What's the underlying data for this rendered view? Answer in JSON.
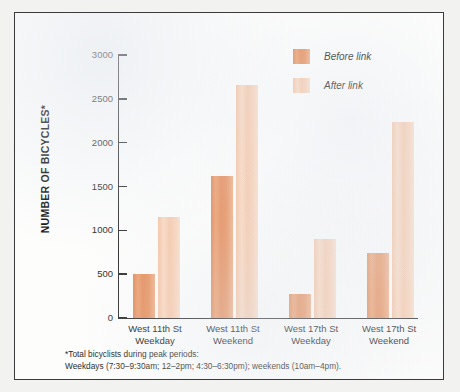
{
  "chart_data": {
    "type": "bar",
    "title": "",
    "xlabel": "",
    "ylabel": "NUMBER OF BICYCLES*",
    "ylim": [
      0,
      3000
    ],
    "ytick_values": [
      3000,
      2500,
      2000,
      1500,
      1000,
      500,
      0
    ],
    "ytick_labels": [
      "3000",
      "2500",
      "2000",
      "1500",
      "1000",
      "500",
      "0"
    ],
    "grid": false,
    "legend_position": "top-right",
    "categories": [
      "West 11th St Weekday",
      "West 11th St Weekend",
      "West 17th St Weekday",
      "West 17th St Weekend"
    ],
    "category_lines": [
      [
        "West 11th St",
        "Weekday"
      ],
      [
        "West 11th St",
        "Weekend"
      ],
      [
        "West 17th St",
        "Weekday"
      ],
      [
        "West 17th St",
        "Weekend"
      ]
    ],
    "series": [
      {
        "name": "Before link",
        "color": "#e89460",
        "values": [
          505,
          1620,
          270,
          745
        ]
      },
      {
        "name": "After link",
        "color": "#f7caac",
        "values": [
          1150,
          2655,
          900,
          2240
        ]
      }
    ]
  },
  "legend": {
    "items": [
      {
        "label": "Before link",
        "color": "#e89460"
      },
      {
        "label": "After link",
        "color": "#f7caac"
      }
    ]
  },
  "footnote": {
    "line1": "*Total bicyclists during peak periods:",
    "line2": "Weekdays (7:30–9:30am; 12–2pm; 4:30–6:30pm); weekends (10am–4pm)."
  },
  "colors": {
    "before": "#e89460",
    "after": "#f7caac",
    "axis": "#2e2e2e",
    "frame": "#3a3a3a",
    "background": "#fdfdfc"
  }
}
